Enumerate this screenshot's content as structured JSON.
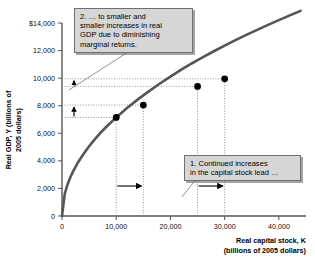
{
  "chart_data": {
    "type": "line",
    "title": "",
    "xlabel": "Real capital stock, K (billions of 2005 dollars)",
    "xlabel_line1": "Real capital stock, K",
    "xlabel_line2": "(billions of 2005 dollars)",
    "ylabel": "Real GDP, Y (billions of 2005 dollars)",
    "ylabel_line1": "Real GDP, Y (billions of",
    "ylabel_line2": "2005 dollars)",
    "xlim": [
      0,
      45000
    ],
    "ylim": [
      0,
      14000
    ],
    "xticks": [
      0,
      10000,
      20000,
      30000,
      40000
    ],
    "xtick_labels": [
      "0",
      "10,000",
      "20,000",
      "30,000",
      "40,000"
    ],
    "yticks": [
      0,
      2000,
      4000,
      6000,
      8000,
      10000,
      12000,
      14000
    ],
    "ytick_labels": [
      "0",
      "2,000",
      "4,000",
      "6,000",
      "8,000",
      "10,000",
      "12,000",
      "$14,000"
    ],
    "grid": false,
    "legend": "none",
    "curve_name": "Per-worker production function (aggregate production function)",
    "curve_color": "#555555",
    "series": [
      {
        "name": "Aggregate production function",
        "x": [
          0,
          500,
          1000,
          1500,
          2000,
          3000,
          4000,
          5000,
          6000,
          7000,
          8000,
          10000,
          12000,
          14000,
          16000,
          18000,
          20000,
          22000,
          24000,
          25000,
          26000,
          28000,
          30000,
          32000,
          34000,
          36000,
          38000,
          40000,
          42000,
          44000
        ],
        "y": [
          0,
          1600,
          2260,
          2770,
          3200,
          3920,
          4520,
          5060,
          5540,
          5990,
          6400,
          7150,
          7830,
          8460,
          9040,
          9590,
          10110,
          10610,
          11080,
          11300,
          11520,
          11950,
          12360,
          12760,
          13140,
          13500,
          13860,
          14210,
          14550,
          14880
        ]
      }
    ],
    "points": [
      {
        "label": "A",
        "x": 10000,
        "y": 7150
      },
      {
        "label": "B",
        "x": 15000,
        "y": 8050
      },
      {
        "label": "C",
        "x": 25000,
        "y": 9400
      },
      {
        "label": "D",
        "x": 30000,
        "y": 9950
      }
    ],
    "annotations": [
      {
        "id": "callout-1",
        "number": "1.",
        "text": "1. Continued increases in the capital stock lead …",
        "line1": "1. Continued increases",
        "line2": "in the capital stock lead …"
      },
      {
        "id": "callout-2",
        "number": "2.",
        "text": "2. … to smaller and smaller increases in real GDP due to diminishing marginal returns.",
        "line1": "2. … to smaller and",
        "line2": "smaller increases in real",
        "line3": "GDP due to diminishing",
        "line4": "marginal returns."
      }
    ],
    "guide_lines": {
      "vertical_at_x": [
        10000,
        15000,
        25000,
        30000
      ],
      "horizontal_at_y": [
        7150,
        8050,
        9400,
        9950
      ]
    },
    "arrows": {
      "horizontal": [
        {
          "from_x": 10000,
          "to_x": 15000,
          "note": "increase in capital stock (first)"
        },
        {
          "from_x": 25000,
          "to_x": 30000,
          "note": "increase in capital stock (second)"
        }
      ],
      "vertical": [
        {
          "from_y": 7150,
          "to_y": 8050,
          "note": "larger increase in real GDP"
        },
        {
          "from_y": 9400,
          "to_y": 9950,
          "note": "smaller increase in real GDP"
        }
      ]
    },
    "colors": {
      "curve": "#555555",
      "point": "#000000",
      "axis": "#444444",
      "callout_bg": "#d6d6d6",
      "callout_border": "#6f6f6f",
      "guide": "#777777"
    }
  }
}
